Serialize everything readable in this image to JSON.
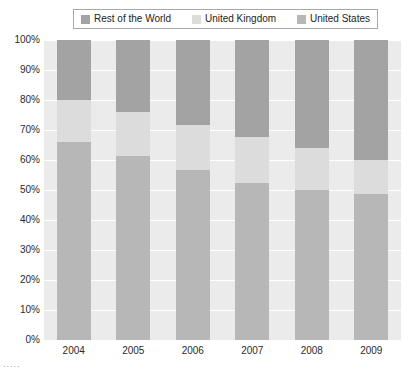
{
  "legend": {
    "position": "top-center",
    "entries": [
      {
        "label": "Rest of the World",
        "color": "#a3a3a3",
        "swatch_icon": "legend-swatch-icon"
      },
      {
        "label": "United Kingdom",
        "color": "#dcdcdc",
        "swatch_icon": "legend-swatch-icon"
      },
      {
        "label": "United States",
        "color": "#b7b7b7",
        "swatch_icon": "legend-swatch-icon"
      }
    ]
  },
  "axes": {
    "y_ticks": [
      "100%",
      "90%",
      "80%",
      "70%",
      "60%",
      "50%",
      "40%",
      "30%",
      "20%",
      "10%",
      "0%"
    ],
    "x_ticks": [
      "2004",
      "2005",
      "2006",
      "2007",
      "2008",
      "2009"
    ]
  },
  "footer": {
    "artifact": "....."
  },
  "chart_data": {
    "type": "bar",
    "subtype": "stacked-100-percent",
    "title": "",
    "subtitle": "",
    "xlabel": "",
    "ylabel": "",
    "ylim": [
      0,
      100
    ],
    "yunit": "%",
    "ytick_step": 10,
    "grid": true,
    "legend_position": "top-center",
    "plot_background": "#ebebeb",
    "gridline_color": "#ffffff",
    "categories": [
      "2004",
      "2005",
      "2006",
      "2007",
      "2008",
      "2009"
    ],
    "series": [
      {
        "name": "United States",
        "color": "#b7b7b7",
        "stack_order": 0,
        "values": [
          66,
          61.5,
          56.7,
          52.3,
          50,
          48.7
        ]
      },
      {
        "name": "United Kingdom",
        "color": "#dcdcdc",
        "stack_order": 1,
        "values": [
          14,
          14.5,
          15,
          15.4,
          14,
          11.3
        ]
      },
      {
        "name": "Rest of the World",
        "color": "#a3a3a3",
        "stack_order": 2,
        "values": [
          20,
          24,
          28.3,
          32.3,
          36,
          40
        ]
      }
    ],
    "cumulative_tops": {
      "United States": [
        66,
        61.5,
        56.7,
        52.3,
        50,
        48.7
      ],
      "United Kingdom": [
        80,
        76,
        71.7,
        67.7,
        64,
        60
      ],
      "Rest of the World": [
        100,
        100,
        100,
        100,
        100,
        100
      ]
    }
  }
}
